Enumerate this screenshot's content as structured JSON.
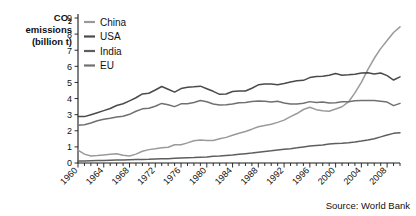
{
  "chart_data": {
    "type": "line",
    "title": "CO2 emissions (billion t)",
    "title_lines": [
      "CO",
      "emissions",
      "(billion t)"
    ],
    "title_sub": "2",
    "xlabel": "",
    "ylabel": "CO2 emissions (billion t)",
    "ylim": [
      0,
      9
    ],
    "xlim": [
      1960,
      2010
    ],
    "yticks": [
      0,
      1,
      2,
      3,
      4,
      5,
      6,
      7,
      8,
      9
    ],
    "ytick_labels": [
      "0",
      "1",
      "2",
      "3",
      "4",
      "5",
      "6",
      "7",
      "8",
      "9"
    ],
    "xticks": [
      1960,
      1964,
      1968,
      1972,
      1976,
      1980,
      1984,
      1988,
      1992,
      1996,
      2000,
      2004,
      2008
    ],
    "xtick_labels": [
      "1960",
      "1964",
      "1968",
      "1972",
      "1976",
      "1980",
      "1984",
      "1988",
      "1992",
      "1996",
      "2000",
      "2004",
      "2008"
    ],
    "xtick_minor_step": 1,
    "grid": false,
    "legend_position": "top-left",
    "source": "Source: World Bank",
    "x": [
      1960,
      1961,
      1962,
      1963,
      1964,
      1965,
      1966,
      1967,
      1968,
      1969,
      1970,
      1971,
      1972,
      1973,
      1974,
      1975,
      1976,
      1977,
      1978,
      1979,
      1980,
      1981,
      1982,
      1983,
      1984,
      1985,
      1986,
      1987,
      1988,
      1989,
      1990,
      1991,
      1992,
      1993,
      1994,
      1995,
      1996,
      1997,
      1998,
      1999,
      2000,
      2001,
      2002,
      2003,
      2004,
      2005,
      2006,
      2007,
      2008,
      2009,
      2010
    ],
    "series": [
      {
        "name": "China",
        "color": "#9a9a9a",
        "values": [
          0.8,
          0.55,
          0.44,
          0.46,
          0.5,
          0.54,
          0.58,
          0.48,
          0.44,
          0.55,
          0.73,
          0.83,
          0.88,
          0.95,
          0.98,
          1.13,
          1.13,
          1.25,
          1.38,
          1.43,
          1.4,
          1.4,
          1.5,
          1.59,
          1.72,
          1.85,
          1.96,
          2.1,
          2.25,
          2.33,
          2.4,
          2.52,
          2.66,
          2.88,
          3.07,
          3.32,
          3.46,
          3.31,
          3.25,
          3.21,
          3.35,
          3.49,
          3.79,
          4.35,
          5.0,
          5.8,
          6.5,
          7.1,
          7.6,
          8.1,
          8.45
        ]
      },
      {
        "name": "USA",
        "color": "#4a4a4a",
        "values": [
          2.89,
          2.88,
          3.0,
          3.12,
          3.25,
          3.38,
          3.57,
          3.68,
          3.86,
          4.05,
          4.29,
          4.33,
          4.53,
          4.75,
          4.58,
          4.4,
          4.62,
          4.7,
          4.73,
          4.77,
          4.61,
          4.45,
          4.26,
          4.28,
          4.44,
          4.47,
          4.47,
          4.64,
          4.85,
          4.91,
          4.9,
          4.86,
          4.93,
          5.03,
          5.1,
          5.13,
          5.3,
          5.37,
          5.39,
          5.45,
          5.55,
          5.45,
          5.47,
          5.51,
          5.58,
          5.6,
          5.52,
          5.59,
          5.42,
          5.15,
          5.35
        ]
      },
      {
        "name": "India",
        "color": "#5e5e5e",
        "values": [
          0.12,
          0.13,
          0.14,
          0.15,
          0.16,
          0.17,
          0.18,
          0.19,
          0.2,
          0.21,
          0.22,
          0.23,
          0.25,
          0.26,
          0.27,
          0.29,
          0.31,
          0.33,
          0.34,
          0.36,
          0.38,
          0.42,
          0.44,
          0.47,
          0.5,
          0.54,
          0.58,
          0.62,
          0.67,
          0.72,
          0.76,
          0.81,
          0.86,
          0.89,
          0.94,
          1.0,
          1.05,
          1.09,
          1.12,
          1.18,
          1.21,
          1.23,
          1.26,
          1.3,
          1.36,
          1.43,
          1.51,
          1.62,
          1.74,
          1.84,
          1.88
        ]
      },
      {
        "name": "EU",
        "color": "#707070",
        "values": [
          2.35,
          2.38,
          2.48,
          2.62,
          2.72,
          2.78,
          2.86,
          2.9,
          3.02,
          3.21,
          3.36,
          3.4,
          3.52,
          3.7,
          3.62,
          3.5,
          3.67,
          3.68,
          3.76,
          3.88,
          3.8,
          3.66,
          3.6,
          3.61,
          3.66,
          3.74,
          3.76,
          3.82,
          3.85,
          3.83,
          3.78,
          3.83,
          3.73,
          3.66,
          3.66,
          3.71,
          3.81,
          3.76,
          3.78,
          3.73,
          3.74,
          3.8,
          3.8,
          3.87,
          3.88,
          3.88,
          3.88,
          3.83,
          3.78,
          3.56,
          3.7
        ]
      }
    ]
  },
  "legend": {
    "entries": [
      {
        "label": "China"
      },
      {
        "label": "USA"
      },
      {
        "label": "India"
      },
      {
        "label": "EU"
      }
    ]
  },
  "footer": {
    "source": "Source: World Bank"
  }
}
